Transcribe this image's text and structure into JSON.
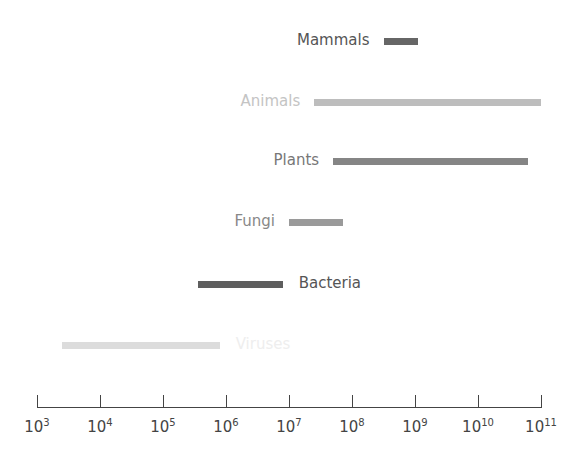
{
  "chart_data": {
    "type": "bar",
    "orientation": "horizontal-range",
    "title": "",
    "xlabel": "",
    "ylabel": "",
    "xscale": "log",
    "xlim_log10": [
      3,
      11
    ],
    "grid": false,
    "legend": "none",
    "tick_labels": [
      "10^3",
      "10^4",
      "10^5",
      "10^6",
      "10^7",
      "10^8",
      "10^9",
      "10^10",
      "10^11"
    ],
    "tick_exponents": [
      3,
      4,
      5,
      6,
      7,
      8,
      9,
      10,
      11
    ],
    "series": [
      {
        "name": "Mammals",
        "min_log10": 8.5,
        "max_log10": 9.05,
        "color": "#666666",
        "label_color": "#555555",
        "label_side": "left"
      },
      {
        "name": "Animals",
        "min_log10": 7.4,
        "max_log10": 11.0,
        "color": "#bdbdbd",
        "label_color": "#c4c4c4",
        "label_side": "left"
      },
      {
        "name": "Plants",
        "min_log10": 7.7,
        "max_log10": 10.8,
        "color": "#858585",
        "label_color": "#777777",
        "label_side": "left"
      },
      {
        "name": "Fungi",
        "min_log10": 7.0,
        "max_log10": 7.85,
        "color": "#9a9a9a",
        "label_color": "#888888",
        "label_side": "left"
      },
      {
        "name": "Bacteria",
        "min_log10": 5.55,
        "max_log10": 6.9,
        "color": "#5e5e5e",
        "label_color": "#555555",
        "label_side": "right"
      },
      {
        "name": "Viruses",
        "min_log10": 3.4,
        "max_log10": 5.9,
        "color": "#dcdcdc",
        "label_color": "#eeeeee",
        "label_side": "right"
      }
    ]
  },
  "layout": {
    "x0": 37,
    "px_per_decade": 63,
    "row_y": [
      41,
      102,
      161,
      222,
      284,
      345
    ],
    "axis_y": 407
  }
}
